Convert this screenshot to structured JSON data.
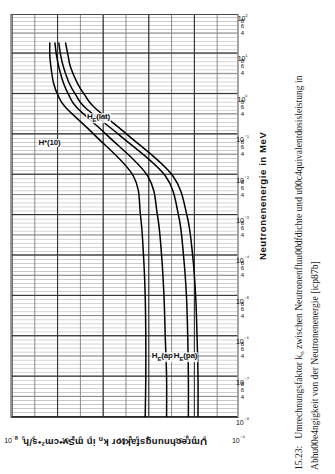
{
  "figure": {
    "caption_number": "15.23:",
    "caption_text": "Umrechnungsfaktor kn zwischen Neutronenfluu00dfdichte und u00c4quivalentdosisleistung in Abhu00e4ngigkeit von der Neutronenenergie [icp87b]"
  },
  "chart_data": {
    "type": "line",
    "title": "",
    "xlabel": "Neutronenenergie in MeV",
    "ylabel": "Umrechnungsfaktor kn in mSv•cm²•s/h",
    "xscale": "log",
    "yscale": "log",
    "xlim": [
      1e-08,
      100
    ],
    "ylim": [
      1e-06,
      0.01
    ],
    "grid": "log-log ruled graph paper, major decade lines plus 2-4-6-8 minor lines",
    "legend": "inline curve labels",
    "x_decade_labels": [
      "10⁻⁸",
      "10⁻⁷",
      "10⁻⁶",
      "10⁻⁵",
      "10⁻⁴",
      "10⁻³",
      "10⁻²",
      "10⁻¹",
      "10⁰",
      "10¹",
      "10²"
    ],
    "x_minor_labels": [
      "4",
      "6",
      "8"
    ],
    "y_decade_labels": [
      "10⁻⁶",
      "10⁻⁵",
      "10⁻⁴",
      "10⁻³",
      "10⁻²"
    ],
    "y_minor_labels": [
      "4",
      "6",
      "8"
    ],
    "series": [
      {
        "name": "H*(10)",
        "label": "H*(10)",
        "label_x_mev": 0.06,
        "label_y": 0.0022,
        "points": [
          {
            "x": 1e-08,
            "y": 4.3e-05
          },
          {
            "x": 1e-07,
            "y": 4.2e-05
          },
          {
            "x": 1e-06,
            "y": 4.2e-05
          },
          {
            "x": 1e-05,
            "y": 4.3e-05
          },
          {
            "x": 0.0001,
            "y": 4.6e-05
          },
          {
            "x": 0.001,
            "y": 5.2e-05
          },
          {
            "x": 0.01,
            "y": 7e-05
          },
          {
            "x": 0.1,
            "y": 0.00033
          },
          {
            "x": 0.5,
            "y": 0.0011
          },
          {
            "x": 1.0,
            "y": 0.0015
          },
          {
            "x": 2.0,
            "y": 0.0018
          },
          {
            "x": 5.0,
            "y": 0.002
          },
          {
            "x": 10.0,
            "y": 0.0021
          },
          {
            "x": 20.0,
            "y": 0.0021
          }
        ]
      },
      {
        "name": "HE(ap)",
        "label": "HE(ap)",
        "label_x_mev": 3e-07,
        "label_y": 2.2e-05,
        "points": [
          {
            "x": 1e-08,
            "y": 1.8e-05
          },
          {
            "x": 1e-07,
            "y": 1.8e-05
          },
          {
            "x": 1e-06,
            "y": 1.9e-05
          },
          {
            "x": 1e-05,
            "y": 2e-05
          },
          {
            "x": 0.0001,
            "y": 2.2e-05
          },
          {
            "x": 0.001,
            "y": 2.6e-05
          },
          {
            "x": 0.01,
            "y": 3.9e-05
          },
          {
            "x": 0.1,
            "y": 0.0002
          },
          {
            "x": 0.5,
            "y": 0.0007
          },
          {
            "x": 1.0,
            "y": 0.00096
          },
          {
            "x": 2.0,
            "y": 0.0012
          },
          {
            "x": 5.0,
            "y": 0.00145
          },
          {
            "x": 10.0,
            "y": 0.0016
          },
          {
            "x": 20.0,
            "y": 0.0017
          }
        ]
      },
      {
        "name": "HE(pa)",
        "label": "HE(pa)",
        "label_x_mev": 3e-07,
        "label_y": 9e-06,
        "points": [
          {
            "x": 1e-08,
            "y": 7.4e-06
          },
          {
            "x": 1e-07,
            "y": 7.4e-06
          },
          {
            "x": 1e-06,
            "y": 7.6e-06
          },
          {
            "x": 1e-05,
            "y": 8e-06
          },
          {
            "x": 0.0001,
            "y": 9e-06
          },
          {
            "x": 0.001,
            "y": 1.1e-05
          },
          {
            "x": 0.01,
            "y": 1.9e-05
          },
          {
            "x": 0.1,
            "y": 0.00012
          },
          {
            "x": 0.5,
            "y": 0.0005
          },
          {
            "x": 1.0,
            "y": 0.00072
          },
          {
            "x": 2.0,
            "y": 0.00095
          },
          {
            "x": 5.0,
            "y": 0.0012
          },
          {
            "x": 10.0,
            "y": 0.00135
          },
          {
            "x": 20.0,
            "y": 0.00145
          }
        ]
      },
      {
        "name": "HE(lat)",
        "label": "HE(lat)",
        "label_x_mev": 0.25,
        "label_y": 0.0003,
        "points": [
          {
            "x": 1e-08,
            "y": 5e-06
          },
          {
            "x": 1e-07,
            "y": 5e-06
          },
          {
            "x": 1e-06,
            "y": 5.2e-06
          },
          {
            "x": 1e-05,
            "y": 5.5e-06
          },
          {
            "x": 0.0001,
            "y": 6.2e-06
          },
          {
            "x": 0.001,
            "y": 7.8e-06
          },
          {
            "x": 0.01,
            "y": 1.4e-05
          },
          {
            "x": 0.1,
            "y": 8.5e-05
          },
          {
            "x": 0.5,
            "y": 0.00034
          },
          {
            "x": 1.0,
            "y": 0.0005
          },
          {
            "x": 2.0,
            "y": 0.00068
          },
          {
            "x": 5.0,
            "y": 0.0009
          },
          {
            "x": 10.0,
            "y": 0.001
          },
          {
            "x": 20.0,
            "y": 0.0011
          }
        ]
      }
    ]
  },
  "axes": {
    "x_title": "Neutronenenergie in MeV",
    "y_title_main": "Umrechnungsfaktor k",
    "y_title_sub": "n",
    "y_title_rest": " in mSv•cm²•s/h"
  }
}
